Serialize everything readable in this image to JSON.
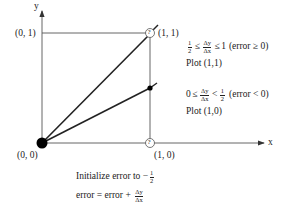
{
  "axes": {
    "x_label": "x",
    "y_label": "y"
  },
  "points": {
    "origin": "(0, 0)",
    "p01": "(0, 1)",
    "p11": "(1, 1)",
    "p10": "(1, 0)",
    "candidate_marker": "?"
  },
  "conditions": [
    {
      "lhs": "1",
      "lhs_den": "2",
      "op1": "≤",
      "frac_num": "Δy",
      "frac_den": "Δx",
      "op2": "≤",
      "rhs": "1",
      "error": "(error ≥ 0)",
      "action": "Plot (1,1)"
    },
    {
      "lhs": "0",
      "op1": "≤",
      "frac_num": "Δy",
      "frac_den": "Δx",
      "op2": "<",
      "rhs_num": "1",
      "rhs_den": "2",
      "error": "(error < 0)",
      "action": "Plot (1,0)"
    }
  ],
  "init": {
    "text": "Initialize error to −",
    "num": "1",
    "den": "2"
  },
  "update": {
    "text": "error = error +",
    "num": "Δy",
    "den": "Δx"
  },
  "colors": {
    "line": "#333333",
    "axis": "#555555",
    "dot": "#000000"
  }
}
